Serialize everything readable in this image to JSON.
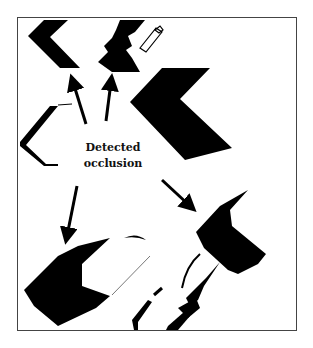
{
  "figure": {
    "annotation": {
      "line1": "Detected",
      "line2": "occlusion"
    },
    "colors": {
      "shape": "#000000",
      "frame": "#444444",
      "background": "#ffffff"
    },
    "arrows": [
      {
        "name": "arrow-up-left",
        "direction": "up"
      },
      {
        "name": "arrow-up-center",
        "direction": "up"
      },
      {
        "name": "arrow-down-left",
        "direction": "down"
      },
      {
        "name": "arrow-down-right",
        "direction": "down-right"
      }
    ]
  }
}
